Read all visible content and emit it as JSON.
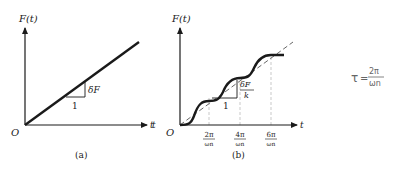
{
  "panel_a": {
    "y_label": "F(t)",
    "x_label": "t",
    "origin": "O",
    "slope_rise": "δF",
    "slope_run": "1",
    "caption": "(a)"
  },
  "panel_b": {
    "y_label": "F(t)",
    "x_label": "t",
    "left_label": "t",
    "origin": "O",
    "slope_rise_num": "δF",
    "slope_rise_den": "k",
    "slope_run": "1",
    "ticks": [
      {
        "num": "2π",
        "den": "ωn"
      },
      {
        "num": "4π",
        "den": "ωn"
      },
      {
        "num": "6π",
        "den": "ωn"
      }
    ],
    "caption": "(b)"
  },
  "annotation": {
    "lhs": "τ",
    "eq": "=",
    "num": "2π",
    "den": "ωn"
  },
  "colors": {
    "ink": "#1a1a1a",
    "dashed": "#555555",
    "guide": "#bbbbbb",
    "handwriting": "#666666"
  }
}
